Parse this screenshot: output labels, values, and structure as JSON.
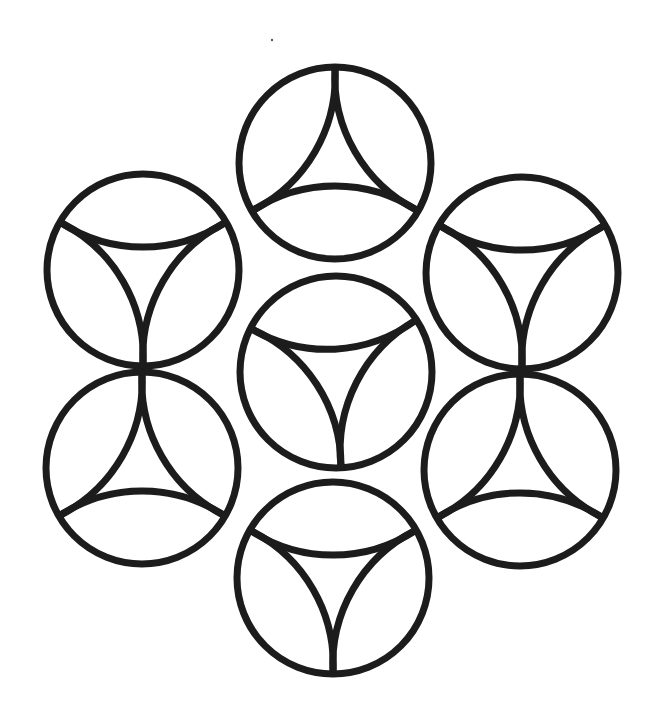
{
  "figure": {
    "stroke_color": "#1c1c1c",
    "background_color": "#ffffff",
    "circle_radius": 96,
    "arc_radius": 150,
    "motifs": [
      {
        "id": "top",
        "cx": 335,
        "cy": 163,
        "rotation_deg": -90
      },
      {
        "id": "upper-left",
        "cx": 143,
        "cy": 270,
        "rotation_deg": 90
      },
      {
        "id": "lower-left",
        "cx": 142,
        "cy": 468,
        "rotation_deg": -90
      },
      {
        "id": "center",
        "cx": 336,
        "cy": 372,
        "rotation_deg": 87
      },
      {
        "id": "upper-right",
        "cx": 522,
        "cy": 273,
        "rotation_deg": 90
      },
      {
        "id": "lower-right",
        "cx": 520,
        "cy": 470,
        "rotation_deg": -90
      },
      {
        "id": "bottom",
        "cx": 333,
        "cy": 578,
        "rotation_deg": 90
      }
    ],
    "speck": {
      "x": 272,
      "y": 40
    }
  }
}
